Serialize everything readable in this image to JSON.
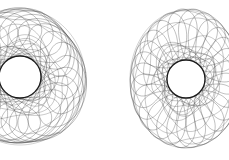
{
  "image": {
    "width": 229,
    "height": 160,
    "background": "#ffffff",
    "description": "Two wireframe torus-like mesh shapes side by side, each with a central circular hole"
  },
  "figures": [
    {
      "name": "left-torus-wireframe",
      "center": [
        20,
        77
      ],
      "outer_radius": [
        65,
        68
      ],
      "hole_radius": 21,
      "meridians": 26,
      "parallels": 9,
      "twist": 0.55,
      "line_color": "#3a3a3a",
      "inner_ring_color": "#1a1a1a",
      "seed": 3
    },
    {
      "name": "right-torus-wireframe",
      "center": [
        186,
        79
      ],
      "outer_radius": [
        56,
        69
      ],
      "hole_radius": 19,
      "meridians": 26,
      "parallels": 9,
      "twist": -0.6,
      "line_color": "#3a3a3a",
      "inner_ring_color": "#1a1a1a",
      "seed": 7
    }
  ]
}
